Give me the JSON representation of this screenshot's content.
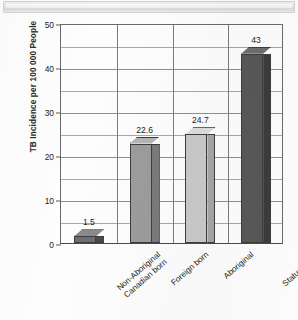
{
  "banner": {
    "label": ""
  },
  "chart_data": {
    "type": "bar",
    "title": "",
    "xlabel": "",
    "ylabel": "TB Incidence per 100 000 People",
    "ylim": [
      0,
      50
    ],
    "ytick_labels": [
      "0",
      "10",
      "20",
      "30",
      "40",
      "50"
    ],
    "ytick_values": [
      0,
      10,
      20,
      30,
      40,
      50
    ],
    "gridline_values": [
      5,
      15,
      25,
      35,
      45
    ],
    "grid": true,
    "legend": "none",
    "categories": [
      "Non-Aboriginal Canadian born",
      "Foreign born",
      "Aboriginal",
      "Status Indian"
    ],
    "category_lines": [
      [
        "Non-Aboriginal",
        "Canadian born"
      ],
      [
        "Foreign born"
      ],
      [
        "Aboriginal"
      ],
      [
        "Status Indian"
      ]
    ],
    "values": [
      1.5,
      22.6,
      24.7,
      43
    ],
    "value_labels": [
      "1.5",
      "22.6",
      "24.7",
      "43"
    ],
    "bar_colors": [
      "#6e6e6e",
      "#9c9c9c",
      "#c9c9c9",
      "#585858"
    ],
    "bar_side_colors": [
      "#4a4a4a",
      "#7a7a7a",
      "#a5a5a5",
      "#3c3c3c"
    ],
    "bar_top_colors": [
      "#8a8a8a",
      "#b4b4b4",
      "#dcdcdc",
      "#6e6e6e"
    ],
    "axis_color": "#555555",
    "grid_color": "#8f8f8f",
    "style": "3d-column"
  }
}
